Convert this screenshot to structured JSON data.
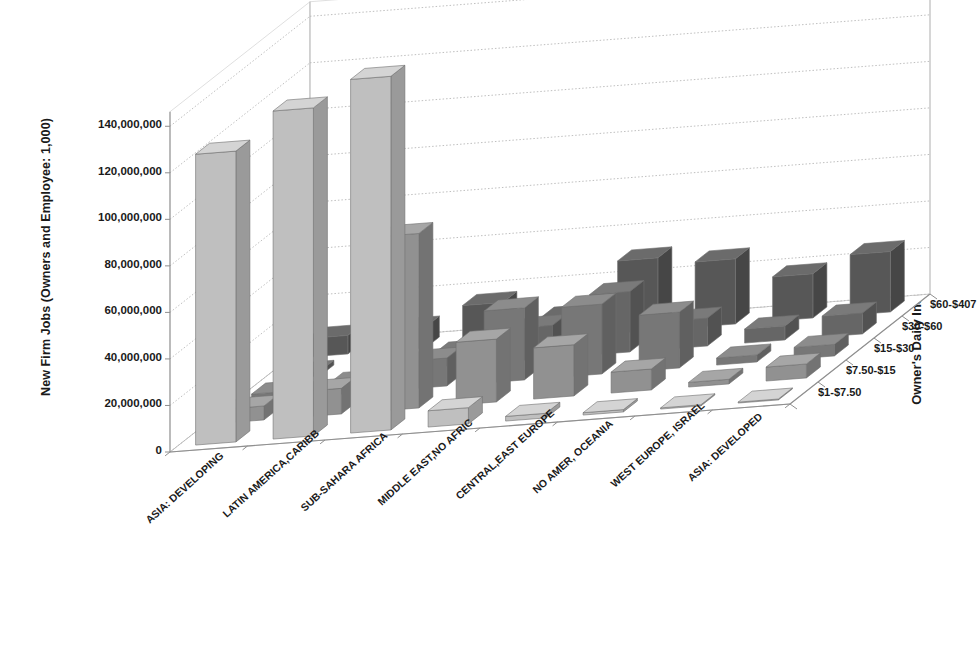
{
  "axes": {
    "y_title": "New Firm Jobs (Owners and Employee: 1,000)",
    "z_title": "Owner's  Daily Income",
    "y_ticks": [
      "0",
      "20,000,000",
      "40,000,000",
      "60,000,000",
      "80,000,000",
      "100,000,000",
      "120,000,000",
      "140,000,000"
    ]
  },
  "chart_data": {
    "type": "bar",
    "title": "",
    "xlabel": "",
    "ylabel": "New Firm Jobs (Owners and Employee: 1,000)",
    "zlabel": "Owner's  Daily Income",
    "ylim": [
      0,
      150000000
    ],
    "grid": true,
    "legend_position": "right-depth-axis",
    "categories": [
      "ASIA: DEVELOPING",
      "LATIN AMERICA,CARIBB",
      "SUB-SAHARA AFRICA",
      "MIDDLE EAST,NO AFRIC",
      "CENTRAL,EAST EUROPE",
      "NO AMER, OCEANIA",
      "WEST EUROPE, ISRAEL",
      "ASIA: DEVELOPED"
    ],
    "series": [
      {
        "name": "$1-$7.50",
        "values": [
          125000000,
          141000000,
          152000000,
          7000000,
          2000000,
          1000000,
          500000,
          400000
        ]
      },
      {
        "name": "$7.50-$15",
        "values": [
          6000000,
          11000000,
          75000000,
          27000000,
          22000000,
          9000000,
          2000000,
          6000000
        ]
      },
      {
        "name": "$15-$30",
        "values": [
          3000000,
          5000000,
          12000000,
          31000000,
          30000000,
          24000000,
          3000000,
          5000000
        ]
      },
      {
        "name": "$30-$60",
        "values": [
          2000000,
          3000000,
          6000000,
          14000000,
          26000000,
          12000000,
          6000000,
          9000000
        ]
      },
      {
        "name": "$60-$407",
        "values": [
          8000000,
          9000000,
          17000000,
          9000000,
          31000000,
          28000000,
          19000000,
          26000000
        ]
      }
    ]
  },
  "colors": {
    "series_top": [
      "#d4d4d4",
      "#a6a6a6",
      "#8c8c8c",
      "#7a7a7a",
      "#6b6b6b"
    ],
    "series_front": [
      "#bfbfbf",
      "#919191",
      "#777777",
      "#666666",
      "#575757"
    ],
    "series_side": [
      "#9a9a9a",
      "#737373",
      "#606060",
      "#525252",
      "#464646"
    ],
    "grid": "#b8b8b8",
    "axis": "#8f8f8f",
    "text": "#1a1a1a"
  }
}
